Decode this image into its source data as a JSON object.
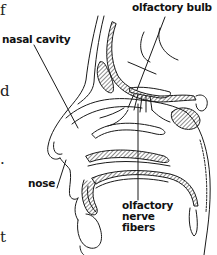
{
  "diagram": {
    "labels": {
      "olfactory_bulb": "olfactory bulb",
      "nasal_cavity": "nasal cavity",
      "nose": "nose",
      "olfactory_nerve_fibers_line1": "olfactory",
      "olfactory_nerve_fibers_line2": "nerve",
      "olfactory_nerve_fibers_line3": "fibers"
    },
    "margin_fragments": [
      "f",
      "d",
      ".",
      "t"
    ],
    "colors": {
      "line": "#1a1a1a",
      "background": "#ffffff"
    }
  }
}
